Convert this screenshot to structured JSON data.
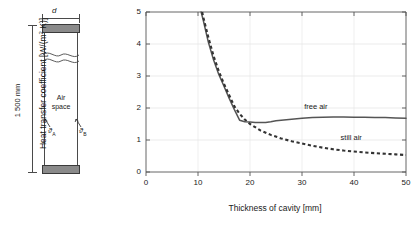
{
  "schematic": {
    "width_label": "d",
    "height_label": "1 500 mm",
    "cavity_label_line1": "Air",
    "cavity_label_line2": "space",
    "temp_a": "ϑ",
    "temp_a_sub": "A",
    "temp_b": "ϑ",
    "temp_b_sub": "B",
    "name": "air-cavity-cross-section"
  },
  "chart_data": {
    "type": "line",
    "title": "",
    "xlabel": "Thickness of cavity [mm]",
    "ylabel": "Heat transfer coefficient [W/(m² K)]",
    "ylabel_main": "Heat transfer coefficient [W/(m",
    "ylabel_sup": "2",
    "ylabel_tail": " K)]",
    "xlim": [
      0,
      50
    ],
    "ylim": [
      0,
      5
    ],
    "xticks": [
      0,
      10,
      20,
      30,
      40,
      50
    ],
    "yticks": [
      0,
      1,
      2,
      3,
      4,
      5
    ],
    "grid": true,
    "legend_position": "inline-annotation",
    "series": [
      {
        "name": "free air",
        "style": "solid",
        "color": "#555555",
        "x": [
          10.6,
          11,
          12,
          13,
          14,
          15,
          16,
          17,
          18,
          19,
          20,
          21,
          22,
          23,
          24,
          25,
          26,
          28,
          30,
          32,
          34,
          36,
          38,
          40,
          42,
          44,
          46,
          48,
          50
        ],
        "y": [
          5.0,
          4.75,
          4.05,
          3.5,
          3.05,
          2.68,
          2.3,
          1.95,
          1.62,
          1.57,
          1.56,
          1.55,
          1.55,
          1.55,
          1.57,
          1.6,
          1.62,
          1.65,
          1.68,
          1.7,
          1.71,
          1.72,
          1.72,
          1.71,
          1.71,
          1.7,
          1.7,
          1.69,
          1.68
        ]
      },
      {
        "name": "still air",
        "style": "dashed",
        "color": "#333333",
        "x": [
          10.8,
          11,
          12,
          13,
          14,
          15,
          16,
          17,
          18,
          19,
          20,
          22,
          24,
          26,
          28,
          30,
          32,
          34,
          36,
          38,
          40,
          42,
          44,
          46,
          48,
          50
        ],
        "y": [
          5.0,
          4.85,
          4.2,
          3.62,
          3.15,
          2.75,
          2.4,
          2.05,
          1.82,
          1.64,
          1.5,
          1.3,
          1.16,
          1.05,
          0.96,
          0.89,
          0.82,
          0.76,
          0.71,
          0.67,
          0.64,
          0.61,
          0.59,
          0.57,
          0.55,
          0.53
        ]
      }
    ],
    "annotations": [
      {
        "text": "free air",
        "x": 33.5,
        "y": 2.02
      },
      {
        "text": "still air",
        "x": 40.5,
        "y": 1.07
      }
    ]
  }
}
